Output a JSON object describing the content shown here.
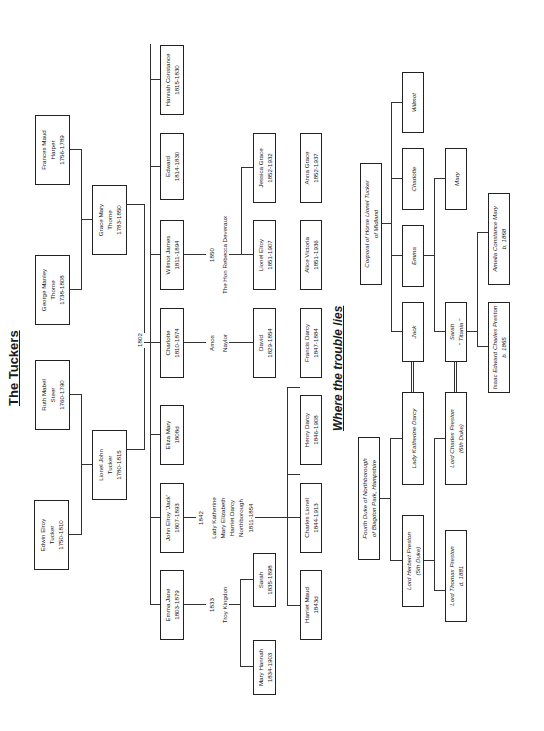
{
  "document": {
    "orientation": "rotated 90 degrees counter-clockwise",
    "title": "The Tuckers",
    "subtitle": "Where the trouble lies"
  },
  "tuckers": {
    "great_grandparents": [
      {
        "name": "Frances Maud",
        "line2": "Harper",
        "dates": "1756-1789"
      },
      {
        "name": "George Manley",
        "line2": "Thorne",
        "dates": "1738-1808"
      },
      {
        "name": "Ruth Mabel",
        "line2": "Steer",
        "dates": "1760-1790"
      },
      {
        "name": "Edwin Elroy",
        "line2": "Tucker",
        "dates": "1750-1810"
      }
    ],
    "grandparents": [
      {
        "name": "Grace Mary",
        "line2": "Thorne",
        "dates": "1783-1850"
      },
      {
        "name": "Lionel John",
        "line2": "Tucker",
        "dates": "1780-1815"
      }
    ],
    "marriage_year": "1802",
    "children": [
      {
        "name": "Hannah Constance",
        "dates": "1815-1830"
      },
      {
        "name": "Edward",
        "dates": "1814-1830"
      },
      {
        "name": "Wilmot James",
        "dates": "1811-1894"
      },
      {
        "name": "Charlotte",
        "dates": "1810-1874"
      },
      {
        "name": "Eliza Mary",
        "dates": "1808d"
      },
      {
        "name": "John Elroy 'Jack'",
        "dates": "1807-1893"
      },
      {
        "name": "Emma Jane",
        "dates": "1803-1879"
      }
    ],
    "spouses": {
      "wilmot": {
        "year": "1850",
        "name": "The Hon Rebecca Deveraux"
      },
      "charlotte": {
        "line1": "Amos",
        "line2": "Naylor"
      },
      "jack": {
        "year": "1842",
        "lines": [
          "Lady Katherine",
          "Mary Elizabeth",
          "Harriet Darcy",
          "Northborough",
          "1811-1854"
        ]
      },
      "emma": {
        "year": "1833",
        "name": "Troy Kingdon"
      }
    },
    "grandchildren_row1": [
      {
        "name": "Jessica Grace",
        "dates": "1852-1932"
      },
      {
        "name": "Lionel Elroy",
        "dates": "1851-1907"
      },
      {
        "name": "David",
        "dates": "1829-1854"
      },
      {
        "name": "Sarah",
        "dates": "1835-1898"
      },
      {
        "name": "Mary Hannah",
        "dates": "1834-1903"
      }
    ],
    "grandchildren_row2": [
      {
        "name": "Anna Grace",
        "dates": "1852-1937"
      },
      {
        "name": "Alice Victoria",
        "dates": "1851-1936"
      },
      {
        "name": "Francis Darcy",
        "dates": "1847-1884"
      },
      {
        "name": "Henry Darcy",
        "dates": "1846-1908"
      },
      {
        "name": "Charles Lionel",
        "dates": "1844-1913"
      },
      {
        "name": "Harriet Maud",
        "dates": "1843d"
      }
    ]
  },
  "trouble": {
    "corporal": {
      "line1": "Corporal of Horse Lionel Tucker",
      "line2": "of Midland"
    },
    "children": [
      {
        "name": "Wilmot"
      },
      {
        "name": "Charlotte"
      },
      {
        "name": "Emma"
      },
      {
        "name": "Jack"
      }
    ],
    "emma_children": [
      {
        "name": "Mary"
      },
      {
        "name": "Sarah",
        "line2": "\" Titania \""
      }
    ],
    "sarah_children": [
      {
        "name": "Amelia Constance Mary",
        "line2": "b. 1868"
      },
      {
        "name": "Isaac Edward Charles Preston",
        "line2": "b. 1865"
      }
    ],
    "lady_katherine": {
      "name": "Lady Katherine Darcy"
    },
    "lord_charles": {
      "name": "Lord Charles Preston",
      "line2": "(6th Duke)"
    },
    "duke": {
      "line1": "Fourth Duke of Northborough",
      "line2": "of Blagdon Park, Hampshire"
    },
    "lord_herbert": {
      "name": "Lord Herbert Preston",
      "line2": "(5th Duke)"
    },
    "lord_thomas": {
      "name": "Lord Thomas Preston",
      "line2": "d. 1881"
    }
  }
}
